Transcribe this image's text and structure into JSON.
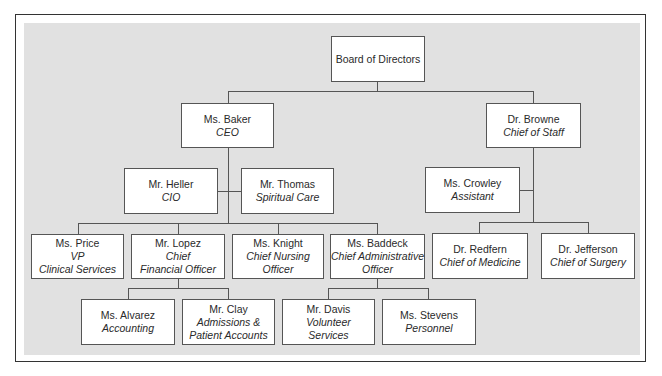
{
  "chart_title": "",
  "colors": {
    "background_panel": "#e1e1e1",
    "box_fill": "#ffffff",
    "line": "#555555",
    "text": "#2a2a2a"
  },
  "nodes": {
    "board": {
      "name": "Board of Directors",
      "title": ""
    },
    "baker": {
      "name": "Ms. Baker",
      "title": "CEO"
    },
    "browne": {
      "name": "Dr. Browne",
      "title": "Chief of Staff"
    },
    "heller": {
      "name": "Mr. Heller",
      "title": "CIO"
    },
    "thomas": {
      "name": "Mr. Thomas",
      "title": "Spiritual Care"
    },
    "crowley": {
      "name": "Ms. Crowley",
      "title": "Assistant"
    },
    "price": {
      "name": "Ms. Price",
      "title": "VP\nClinical Services"
    },
    "lopez": {
      "name": "Mr. Lopez",
      "title": "Chief\nFinancial Officer"
    },
    "knight": {
      "name": "Ms. Knight",
      "title": "Chief Nursing\nOfficer"
    },
    "baddeck": {
      "name": "Ms. Baddeck",
      "title": "Chief Administrative\nOfficer"
    },
    "redfern": {
      "name": "Dr. Redfern",
      "title": "Chief of Medicine"
    },
    "jefferson": {
      "name": "Dr. Jefferson",
      "title": "Chief of Surgery"
    },
    "alvarez": {
      "name": "Ms. Alvarez",
      "title": "Accounting"
    },
    "clay": {
      "name": "Mr. Clay",
      "title": "Admissions &\nPatient Accounts"
    },
    "davis": {
      "name": "Mr. Davis",
      "title": "Volunteer\nServices"
    },
    "stevens": {
      "name": "Ms. Stevens",
      "title": "Personnel"
    }
  },
  "hierarchy": [
    {
      "parent": "board",
      "children": [
        "baker",
        "browne"
      ]
    },
    {
      "parent": "baker",
      "children": [
        "heller",
        "thomas",
        "price",
        "lopez",
        "knight",
        "baddeck"
      ]
    },
    {
      "parent": "browne",
      "children": [
        "crowley",
        "redfern",
        "jefferson"
      ]
    },
    {
      "parent": "lopez",
      "children": [
        "alvarez",
        "clay"
      ]
    },
    {
      "parent": "baddeck",
      "children": [
        "davis",
        "stevens"
      ]
    }
  ]
}
